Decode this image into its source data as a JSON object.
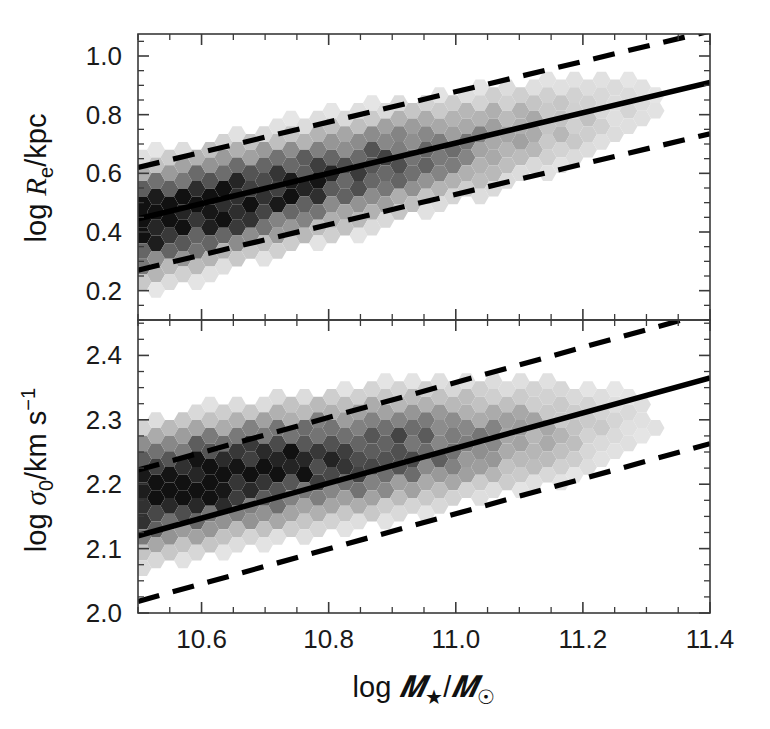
{
  "figure": {
    "background_color": "#ffffff",
    "width": 770,
    "height": 729,
    "panel_count": 2
  },
  "xaxis": {
    "label_prefix": "log",
    "label_math": "ℳ★/ℳ☉",
    "label_full": "log ℳ★/ℳ☉",
    "ticks": [
      "10.6",
      "10.8",
      "11.0",
      "11.2",
      "11.4"
    ],
    "tick_values": [
      10.6,
      10.8,
      11.0,
      11.2,
      11.4
    ],
    "range": [
      10.5,
      11.4
    ],
    "minor_per_interval": 4
  },
  "panel_top": {
    "ylabel_full": "log Rₑ/kpc",
    "ylabel_prefix": "log",
    "ylabel_sym": "R",
    "ylabel_sub": "e",
    "ylabel_suffix": "/kpc",
    "ticks": [
      "1.0",
      "0.8",
      "0.6",
      "0.4",
      "0.2"
    ],
    "tick_values": [
      1.0,
      0.8,
      0.6,
      0.4,
      0.2
    ],
    "range": [
      0.1,
      1.075
    ],
    "minor_per_interval": 4
  },
  "panel_bottom": {
    "ylabel_full": "log σ₀/km s⁻¹",
    "ylabel_prefix": "log",
    "ylabel_sym": "σ",
    "ylabel_sub": "0",
    "ylabel_suffix": "/km s",
    "ylabel_sup": "−1",
    "ticks": [
      "2.4",
      "2.3",
      "2.2",
      "2.1",
      "2.0"
    ],
    "tick_values": [
      2.4,
      2.3,
      2.2,
      2.1,
      2.0
    ],
    "range": [
      2.0,
      2.455
    ],
    "minor_per_interval": 4
  },
  "chart_data": {
    "type": "heatmap",
    "title": "",
    "subtitle": "",
    "xlabel": "log ℳ★/ℳ☉",
    "grid": false,
    "legend": "none",
    "binning": "hexagonal",
    "colormap": "greyscale, dark = high density",
    "panels": [
      {
        "name": "size-mass-relation",
        "ylabel": "log Rₑ/kpc",
        "xlim": [
          10.5,
          11.4
        ],
        "ylim": [
          0.1,
          1.075
        ],
        "xticks": [
          10.6,
          10.8,
          11.0,
          11.2,
          11.4
        ],
        "yticks": [
          0.2,
          0.4,
          0.6,
          0.8,
          1.0
        ],
        "fit_line": {
          "style": "solid",
          "x": [
            10.5,
            11.4
          ],
          "y": [
            0.445,
            0.91
          ],
          "slope": 0.517,
          "intercept": -4.986
        },
        "scatter_bands": [
          {
            "name": "upper-1sigma",
            "style": "dashed",
            "x": [
              10.5,
              11.4
            ],
            "y": [
              0.62,
              1.085
            ],
            "offset": 0.175
          },
          {
            "name": "lower-1sigma",
            "style": "dashed",
            "x": [
              10.5,
              11.4
            ],
            "y": [
              0.27,
              0.735
            ],
            "offset": -0.175
          }
        ],
        "density_ridge": {
          "x": [
            10.52,
            10.6,
            10.68,
            10.76,
            10.84,
            10.92,
            11.0,
            11.08,
            11.16,
            11.24,
            11.32
          ],
          "y": [
            0.435,
            0.477,
            0.518,
            0.56,
            0.601,
            0.643,
            0.684,
            0.726,
            0.767,
            0.809,
            0.85
          ],
          "peak_counts": [
            95,
            88,
            74,
            62,
            50,
            40,
            28,
            18,
            10,
            5,
            2
          ],
          "sigma": 0.088
        }
      },
      {
        "name": "velocity-dispersion-mass-relation",
        "ylabel": "log σ₀/km s⁻¹",
        "xlim": [
          10.5,
          11.4
        ],
        "ylim": [
          2.0,
          2.455
        ],
        "xticks": [
          10.6,
          10.8,
          11.0,
          11.2,
          11.4
        ],
        "yticks": [
          2.0,
          2.1,
          2.2,
          2.3,
          2.4
        ],
        "fit_line": {
          "style": "solid",
          "x": [
            10.5,
            11.4
          ],
          "y": [
            2.12,
            2.365
          ],
          "slope": 0.272,
          "intercept": -0.736
        },
        "scatter_bands": [
          {
            "name": "upper-1sigma",
            "style": "dashed",
            "x": [
              10.5,
              11.4
            ],
            "y": [
              2.222,
              2.467
            ],
            "offset": 0.102
          },
          {
            "name": "lower-1sigma",
            "style": "dashed",
            "x": [
              10.5,
              11.4
            ],
            "y": [
              2.018,
              2.263
            ],
            "offset": -0.102
          }
        ],
        "density_ridge": {
          "x": [
            10.52,
            10.6,
            10.68,
            10.76,
            10.84,
            10.92,
            11.0,
            11.08,
            11.16,
            11.24,
            11.32
          ],
          "y": [
            2.187,
            2.204,
            2.218,
            2.231,
            2.243,
            2.254,
            2.264,
            2.273,
            2.281,
            2.288,
            2.294
          ],
          "peak_counts": [
            92,
            86,
            78,
            70,
            58,
            46,
            32,
            20,
            11,
            5,
            2
          ],
          "sigma": 0.044
        }
      }
    ]
  }
}
